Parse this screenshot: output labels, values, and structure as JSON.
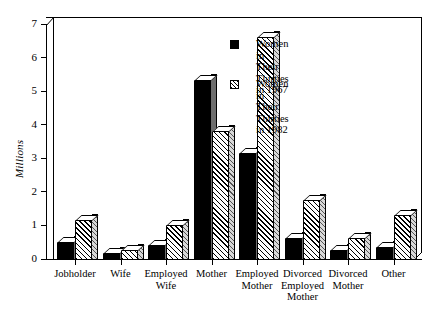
{
  "chart_data": {
    "type": "bar",
    "title": "",
    "xlabel": "",
    "ylabel": "Millions",
    "ylim": [
      0,
      7
    ],
    "ytick_labels": [
      "0",
      "1",
      "2",
      "3",
      "4",
      "5",
      "6",
      "7"
    ],
    "ytick_values": [
      0,
      1,
      2,
      3,
      4,
      5,
      6,
      7
    ],
    "grid": false,
    "legend_position": "upper-right-inside",
    "categories": [
      "Jobholder",
      "Wife",
      "Employed\nWife",
      "Mother",
      "Employed\nMother",
      "Divorced\nEmployed\nMother",
      "Divorced\nMother",
      "Other"
    ],
    "series": [
      {
        "name": "Women in Their\nThirties in 1967",
        "fill": "solid-black",
        "values": [
          0.55,
          0.2,
          0.45,
          5.35,
          3.2,
          0.65,
          0.3,
          0.4
        ]
      },
      {
        "name": "Women in Their\nThirties in 1982",
        "fill": "diagonal-hatch",
        "values": [
          1.2,
          0.3,
          1.05,
          3.85,
          6.65,
          1.8,
          0.65,
          1.35
        ]
      }
    ]
  },
  "legend": {
    "items": [
      {
        "label": "Women in Their\nThirties in 1967",
        "swatch": "solid-black-swatch"
      },
      {
        "label": "Women in Their\nThirties in 1982",
        "swatch": "hatched-swatch"
      }
    ]
  },
  "colors": {
    "bar_1967": "#000000",
    "bar_1982_hatch": "#000000",
    "bar_1982_background": "#ffffff",
    "side_face": "#9a9a9a",
    "axis": "#000000",
    "background": "#ffffff"
  }
}
